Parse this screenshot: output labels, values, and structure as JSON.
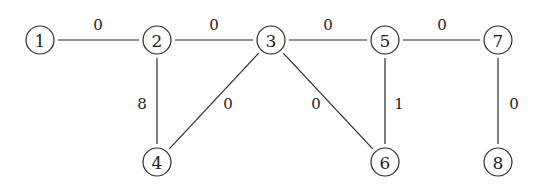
{
  "diagram": {
    "type": "weighted-undirected-graph",
    "colors": {
      "stroke": "#2a2a2a",
      "text": "#1e1e1e",
      "background": "#ffffff"
    },
    "node_radius": 14,
    "nodes": [
      {
        "id": "1",
        "label": "1",
        "x": 40,
        "y": 40
      },
      {
        "id": "2",
        "label": "2",
        "x": 157,
        "y": 40
      },
      {
        "id": "3",
        "label": "3",
        "x": 271,
        "y": 40
      },
      {
        "id": "5",
        "label": "5",
        "x": 385,
        "y": 40
      },
      {
        "id": "7",
        "label": "7",
        "x": 498,
        "y": 40
      },
      {
        "id": "4",
        "label": "4",
        "x": 157,
        "y": 162
      },
      {
        "id": "6",
        "label": "6",
        "x": 385,
        "y": 162
      },
      {
        "id": "8",
        "label": "8",
        "x": 498,
        "y": 162
      }
    ],
    "edges": [
      {
        "from": "1",
        "to": "2",
        "weight": "0",
        "label_x": 98,
        "label_y": 25
      },
      {
        "from": "2",
        "to": "3",
        "weight": "0",
        "label_x": 214,
        "label_y": 25
      },
      {
        "from": "3",
        "to": "5",
        "weight": "0",
        "label_x": 328,
        "label_y": 25
      },
      {
        "from": "5",
        "to": "7",
        "weight": "0",
        "label_x": 442,
        "label_y": 25
      },
      {
        "from": "2",
        "to": "4",
        "weight": "8",
        "label_x": 142,
        "label_y": 104
      },
      {
        "from": "3",
        "to": "4",
        "weight": "0",
        "label_x": 228,
        "label_y": 104
      },
      {
        "from": "3",
        "to": "6",
        "weight": "0",
        "label_x": 316,
        "label_y": 104
      },
      {
        "from": "5",
        "to": "6",
        "weight": "1",
        "label_x": 399,
        "label_y": 104
      },
      {
        "from": "7",
        "to": "8",
        "weight": "0",
        "label_x": 514,
        "label_y": 104
      }
    ]
  }
}
